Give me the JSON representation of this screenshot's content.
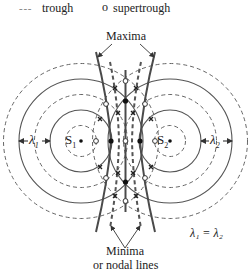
{
  "legend": {
    "trough_label": "trough",
    "trough_symbol": "- - -",
    "supertrough_label": "supertrough",
    "supertrough_symbol": "o"
  },
  "labels": {
    "maxima": "Maxima",
    "minima_line1": "Minima",
    "minima_line2": "or nodal lines",
    "source1": "S",
    "source1_sub": "1",
    "source2": "S",
    "source2_sub": "2",
    "lambda1": "λ",
    "lambda1_sub": "1",
    "lambda2": "λ",
    "lambda2_sub": "2",
    "equality": "λ₁ = λ₂"
  },
  "colors": {
    "line": "#555555",
    "heavy": "#4a4a4a",
    "text": "#222222"
  },
  "geometry": {
    "source1": [
      81,
      141
    ],
    "source2": [
      170,
      141
    ],
    "crest_radii": [
      31,
      62
    ],
    "trough_radii": [
      15.5,
      46.5,
      77.5
    ]
  }
}
